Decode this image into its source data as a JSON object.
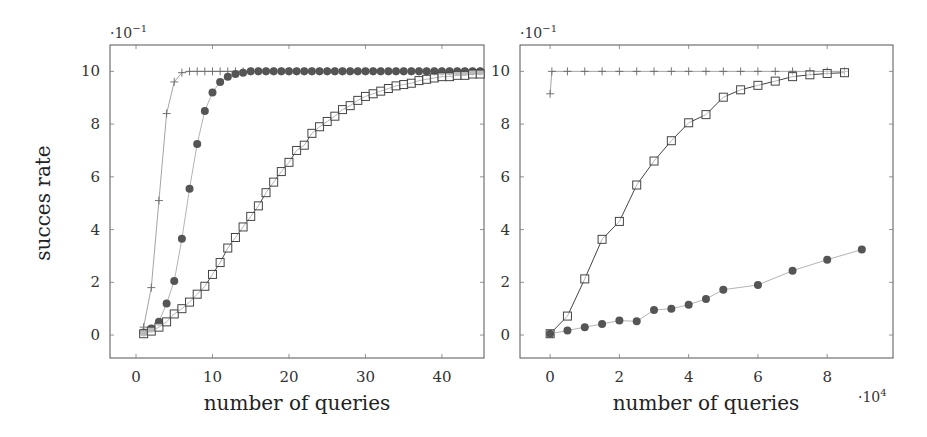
{
  "chart_data": [
    {
      "type": "line",
      "panel": "left",
      "title": "",
      "xlabel": "number of queries",
      "ylabel": "succes rate",
      "y_scale_label": "·10⁻¹",
      "x_scale_label": "",
      "xlim": [
        -3.4,
        45.5
      ],
      "ylim": [
        -0.87,
        11
      ],
      "xticks": [
        0,
        10,
        20,
        30,
        40
      ],
      "yticks": [
        0,
        2,
        4,
        6,
        8,
        10
      ],
      "grid": false,
      "legend": null,
      "series": [
        {
          "name": "plus",
          "marker": "plus",
          "x": [
            1,
            2,
            3,
            4,
            5,
            6,
            7,
            8,
            9,
            10,
            11,
            12,
            13,
            14,
            15,
            16,
            17,
            18,
            19,
            20,
            21,
            22,
            23,
            24,
            25,
            26,
            27,
            28,
            29,
            30,
            31,
            32,
            33,
            34,
            35,
            36,
            37,
            38,
            39,
            40,
            41,
            42,
            43,
            44,
            45
          ],
          "values": [
            0.3,
            1.8,
            5.1,
            8.4,
            9.6,
            9.95,
            10,
            10,
            10,
            10,
            10,
            10,
            10,
            10,
            10,
            10,
            10,
            10,
            10,
            10,
            10,
            10,
            10,
            10,
            10,
            10,
            10,
            10,
            10,
            10,
            10,
            10,
            10,
            10,
            10,
            10,
            10,
            10,
            10,
            10,
            10,
            10,
            10,
            10,
            10
          ]
        },
        {
          "name": "circle",
          "marker": "circle",
          "x": [
            1,
            2,
            3,
            4,
            5,
            6,
            7,
            8,
            9,
            10,
            11,
            12,
            13,
            14,
            15,
            16,
            17,
            18,
            19,
            20,
            21,
            22,
            23,
            24,
            25,
            26,
            27,
            28,
            29,
            30,
            31,
            32,
            33,
            34,
            35,
            36,
            37,
            38,
            39,
            40,
            41,
            42,
            43,
            44,
            45
          ],
          "values": [
            0.1,
            0.25,
            0.5,
            1.2,
            2.05,
            3.65,
            5.55,
            7.25,
            8.5,
            9.2,
            9.6,
            9.8,
            9.9,
            9.95,
            10,
            10,
            10,
            10,
            10,
            10,
            10,
            10,
            10,
            10,
            10,
            10,
            10,
            10,
            10,
            10,
            10,
            10,
            10,
            10,
            10,
            10,
            10,
            10,
            10,
            10,
            10,
            10,
            10,
            10,
            10
          ]
        },
        {
          "name": "square",
          "marker": "square",
          "x": [
            1,
            2,
            3,
            4,
            5,
            6,
            7,
            8,
            9,
            10,
            11,
            12,
            13,
            14,
            15,
            16,
            17,
            18,
            19,
            20,
            21,
            22,
            23,
            24,
            25,
            26,
            27,
            28,
            29,
            30,
            31,
            32,
            33,
            34,
            35,
            36,
            37,
            38,
            39,
            40,
            41,
            42,
            43,
            44,
            45
          ],
          "values": [
            0.05,
            0.15,
            0.3,
            0.5,
            0.8,
            1.0,
            1.25,
            1.55,
            1.85,
            2.3,
            2.75,
            3.3,
            3.7,
            4.1,
            4.5,
            4.9,
            5.4,
            5.8,
            6.2,
            6.55,
            7.0,
            7.2,
            7.65,
            7.9,
            8.1,
            8.3,
            8.55,
            8.7,
            8.9,
            9.05,
            9.15,
            9.25,
            9.35,
            9.45,
            9.5,
            9.55,
            9.65,
            9.7,
            9.75,
            9.8,
            9.8,
            9.85,
            9.85,
            9.9,
            9.9
          ]
        }
      ]
    },
    {
      "type": "line",
      "panel": "right",
      "title": "",
      "xlabel": "number of queries",
      "ylabel": "",
      "y_scale_label": "·10⁻¹",
      "x_scale_label": "·10⁴",
      "xlim": [
        -0.87,
        9.9
      ],
      "ylim": [
        -0.87,
        11
      ],
      "xticks": [
        0,
        2,
        4,
        6,
        8
      ],
      "yticks": [
        0,
        2,
        4,
        6,
        8,
        10
      ],
      "grid": false,
      "legend": null,
      "series": [
        {
          "name": "plus",
          "marker": "plus",
          "x": [
            0,
            0.05,
            0.5,
            1.0,
            1.5,
            2.0,
            2.5,
            3.0,
            3.5,
            4.0,
            4.5,
            5.0,
            5.5,
            6.0,
            6.5,
            7.0,
            7.5,
            8.0,
            8.5
          ],
          "values": [
            9.15,
            10,
            10,
            10,
            10,
            10,
            10,
            10,
            10,
            10,
            10,
            10,
            10,
            10,
            10,
            10,
            10,
            10,
            10
          ]
        },
        {
          "name": "square",
          "marker": "square",
          "x": [
            0,
            0.5,
            1.0,
            1.5,
            2.0,
            2.5,
            3.0,
            3.5,
            4.0,
            4.5,
            5.0,
            5.5,
            6.0,
            6.5,
            7.0,
            7.5,
            8.0,
            8.5
          ],
          "values": [
            0.05,
            0.72,
            2.13,
            3.63,
            4.31,
            5.69,
            6.6,
            7.37,
            8.05,
            8.36,
            9.02,
            9.3,
            9.47,
            9.63,
            9.8,
            9.87,
            9.92,
            9.95
          ]
        },
        {
          "name": "circle",
          "marker": "circle",
          "x": [
            0,
            0.5,
            1.0,
            1.5,
            2.0,
            2.5,
            3.0,
            3.5,
            4.0,
            4.5,
            5.0,
            6.0,
            7.0,
            8.0,
            9.0
          ],
          "values": [
            0.05,
            0.17,
            0.3,
            0.42,
            0.55,
            0.52,
            0.95,
            1.0,
            1.15,
            1.37,
            1.72,
            1.9,
            2.44,
            2.86,
            3.24
          ]
        }
      ]
    }
  ],
  "panels": {
    "left": {
      "xlabel": "number of queries",
      "ylabel": "succes rate",
      "y_scale_label": "·10",
      "y_scale_exp": "−1",
      "x_scale_label": "",
      "x_scale_exp": ""
    },
    "right": {
      "xlabel": "number of queries",
      "ylabel": "",
      "y_scale_label": "·10",
      "y_scale_exp": "−1",
      "x_scale_label": "·10",
      "x_scale_exp": "4"
    }
  },
  "colors": {
    "frame": "#555555",
    "tick_label": "#333333",
    "plus_line": "#9a9a9a",
    "plus_marker": "#666666",
    "circle_line": "#aaaaaa",
    "circle_fill": "#555555",
    "square_line": "#444444",
    "square_stroke": "#444444"
  }
}
